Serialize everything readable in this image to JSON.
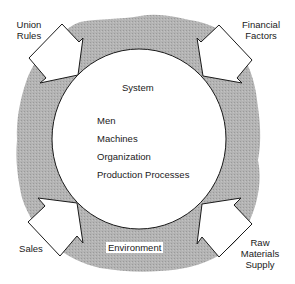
{
  "diagram": {
    "system_title": "System",
    "system_items": [
      "Men",
      "Machines",
      "Organization",
      "Production Processes"
    ],
    "environment_label": "Environment",
    "inputs": [
      {
        "label_line1": "Union",
        "label_line2": "Rules",
        "position": "top-left"
      },
      {
        "label_line1": "Financial",
        "label_line2": "Factors",
        "position": "top-right"
      },
      {
        "label_line1": "Sales",
        "label_line2": "",
        "position": "bottom-left"
      },
      {
        "label_line1": "Raw",
        "label_line2": "Materials",
        "label_line3": "Supply",
        "position": "bottom-right"
      }
    ]
  },
  "colors": {
    "environment_fill": "#a9a9a9",
    "system_fill": "#ffffff",
    "stroke": "#1a1a1a"
  }
}
